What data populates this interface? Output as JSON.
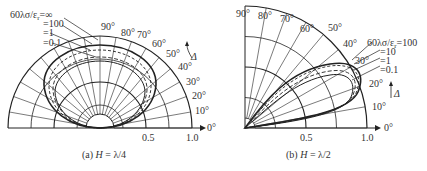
{
  "figure_a": {
    "caption_prefix": "(a) ",
    "caption_var": "H",
    "caption_rest": " = λ/4",
    "angle_labels": [
      "90°",
      "80°",
      "70°",
      "60°",
      "50°",
      "40°",
      "30°",
      "20°",
      "10°",
      "0°"
    ],
    "radial_labels": [
      "0.5",
      "1.0"
    ],
    "param_label": "60λσ/ε",
    "param_sub": "r",
    "param_values": [
      "=∞",
      "=100",
      "=1",
      "=0.1"
    ],
    "delta_label": "Δ"
  },
  "figure_b": {
    "caption_prefix": "(b) ",
    "caption_var": "H",
    "caption_rest": " = λ/2",
    "angle_labels": [
      "90°",
      "80°",
      "70°",
      "60°",
      "50°",
      "40°",
      "30°",
      "20°",
      "10°",
      "0°"
    ],
    "radial_labels": [
      "0.5",
      "1.0"
    ],
    "param_label": "60λσ/ε",
    "param_sub": "r",
    "param_values": [
      "=100",
      "=10",
      "=1",
      "=0.1"
    ],
    "delta_label": "Δ"
  }
}
